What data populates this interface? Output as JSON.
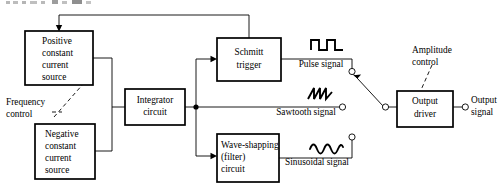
{
  "diagram": {
    "title_fragment": "",
    "blocks": [
      {
        "id": "positive-source",
        "lines": [
          "Positive",
          "constant",
          "current",
          "source"
        ],
        "x": 25,
        "y": 31,
        "w": 68,
        "h": 54
      },
      {
        "id": "negative-source",
        "lines": [
          "Negative",
          "constant",
          "current",
          "source"
        ],
        "x": 35,
        "y": 124,
        "w": 60,
        "h": 55
      },
      {
        "id": "integrator-circuit",
        "lines": [
          "Integrator",
          "circuit"
        ],
        "x": 125,
        "y": 89,
        "w": 60,
        "h": 36
      },
      {
        "id": "schmitt-trigger",
        "lines": [
          "Schmitt",
          "trigger"
        ],
        "x": 217,
        "y": 38,
        "w": 64,
        "h": 43
      },
      {
        "id": "wave-shaping-circuit",
        "lines": [
          "Wave-shapping",
          "(filter)",
          "circuit"
        ],
        "x": 217,
        "y": 134,
        "w": 62,
        "h": 48
      },
      {
        "id": "output-driver",
        "lines": [
          "Output",
          "driver"
        ],
        "x": 397,
        "y": 91,
        "w": 56,
        "h": 36
      }
    ],
    "signals": {
      "pulse": "Pulse signal",
      "sawtooth": "Sawtooth signal",
      "sinusoidal": "Sinusoidal signal",
      "output": [
        "Output",
        "signal"
      ]
    },
    "controls": {
      "frequency": [
        "Frequency",
        "control"
      ],
      "amplitude": [
        "Amplitude",
        "control"
      ]
    },
    "icons": {
      "pulse_wave": "square-wave-icon",
      "sawtooth_wave": "sawtooth-wave-icon",
      "sine_wave": "sine-wave-icon",
      "selector_switch": "selector-switch-icon"
    },
    "colors": {
      "line": "#000000",
      "background": "#ffffff",
      "box_fill": "#ffffff"
    }
  }
}
